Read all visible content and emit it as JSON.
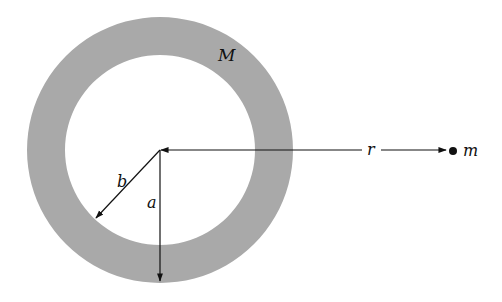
{
  "diagram": {
    "type": "physics-figure",
    "labels": {
      "shell_mass": "M",
      "outer_radius": "a",
      "inner_radius": "b",
      "distance": "r",
      "point_mass": "m"
    },
    "colors": {
      "shell_fill": "#a9a9a9",
      "line": "#111111",
      "background": "#ffffff"
    },
    "geometry": {
      "center": [
        160,
        150
      ],
      "outer_radius_px": 133,
      "inner_radius_px": 95,
      "point_mass_position": [
        453,
        151
      ]
    }
  }
}
